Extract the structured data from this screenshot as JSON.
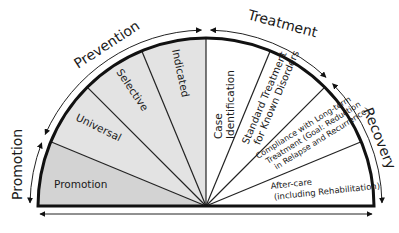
{
  "diagram": {
    "outer_labels": {
      "promotion": "Promotion",
      "prevention": "Prevention",
      "treatment": "Treatment",
      "recovery": "Recovery"
    },
    "sectors": [
      {
        "lines": [
          "Promotion"
        ],
        "fill": "#d3d3d3"
      },
      {
        "lines": [
          "Universal"
        ],
        "fill": "#e3e3e3"
      },
      {
        "lines": [
          "Selective"
        ],
        "fill": "#e3e3e3"
      },
      {
        "lines": [
          "Indicated"
        ],
        "fill": "#e3e3e3"
      },
      {
        "lines": [
          "Case",
          "Identification"
        ],
        "fill": "#ffffff"
      },
      {
        "lines": [
          "Standard Treatment",
          "for Known Disorders"
        ],
        "fill": "#ffffff"
      },
      {
        "lines": [
          "Compliance with Long-term",
          "Treatment (Goal: Reduction",
          "in Relapse and Recurrence)"
        ],
        "fill": "#ffffff"
      },
      {
        "lines": [
          "After-care",
          "(including Rehabilitation)"
        ],
        "fill": "#ffffff"
      }
    ],
    "colors": {
      "stroke": "#111111",
      "promotion_fill": "#d3d3d3",
      "prevention_fill": "#e3e3e3",
      "treatment_fill": "#ffffff"
    }
  }
}
